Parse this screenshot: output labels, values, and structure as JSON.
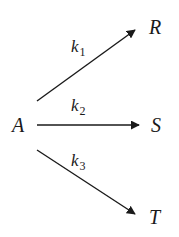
{
  "diagram": {
    "type": "reaction-scheme",
    "reactant": {
      "label": "A"
    },
    "products": [
      {
        "label": "R",
        "rate_constant": {
          "base": "k",
          "subscript": "1"
        }
      },
      {
        "label": "S",
        "rate_constant": {
          "base": "k",
          "subscript": "2"
        }
      },
      {
        "label": "T",
        "rate_constant": {
          "base": "k",
          "subscript": "3"
        }
      }
    ],
    "colors": {
      "ink": "#1a1a1a",
      "background": "#ffffff"
    }
  }
}
